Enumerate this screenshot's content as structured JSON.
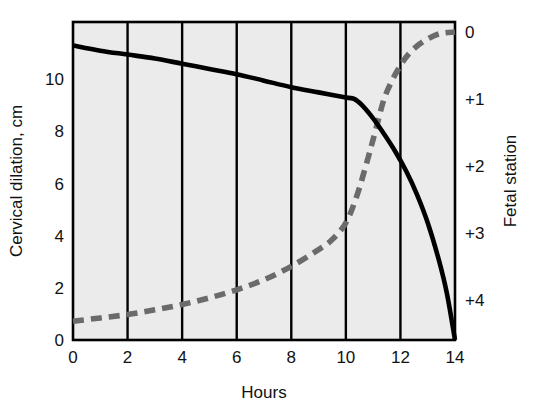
{
  "chart_data": {
    "type": "line",
    "title": "",
    "subtitle": "",
    "xlabel": "Hours",
    "ylabel": "Cervical dilation, cm",
    "y2label": "Fetal station",
    "xlim": [
      0,
      14
    ],
    "ylim": [
      0,
      12.2
    ],
    "y2lim": [
      4.6,
      -0.15
    ],
    "xticks": [
      "0",
      "2",
      "4",
      "6",
      "8",
      "10",
      "12",
      "14"
    ],
    "xtick_values": [
      0,
      2,
      4,
      6,
      8,
      10,
      12,
      14
    ],
    "yticks": [
      "0",
      "2",
      "4",
      "6",
      "8",
      "10"
    ],
    "ytick_values": [
      0,
      2,
      4,
      6,
      8,
      10
    ],
    "y2ticks": [
      "0",
      "+1",
      "+2",
      "+3",
      "+4"
    ],
    "y2tick_values": [
      0,
      1,
      2,
      3,
      4
    ],
    "grid": "vertical-only",
    "grid_color": "#000000",
    "plot_background": "#ebebeb",
    "legend": "none",
    "series": [
      {
        "name": "Cervical dilation",
        "style": "solid",
        "color": "#000000",
        "axis": "left",
        "x": [
          0,
          1,
          2,
          3,
          4,
          5,
          6,
          7,
          8,
          9,
          10,
          10.3,
          10.6,
          11,
          11.4,
          11.8,
          12.2,
          12.6,
          13,
          13.4,
          13.7,
          14
        ],
        "values": [
          11.3,
          11.1,
          10.95,
          10.8,
          10.6,
          10.4,
          10.2,
          9.95,
          9.7,
          9.5,
          9.3,
          9.25,
          9.0,
          8.5,
          7.9,
          7.25,
          6.5,
          5.6,
          4.5,
          3.1,
          1.8,
          0.0
        ]
      },
      {
        "name": "Fetal station",
        "style": "dashed",
        "color": "#6b6b6b",
        "axis": "right",
        "x": [
          0,
          1,
          2,
          3,
          4,
          5,
          6,
          7,
          8,
          9,
          9.5,
          10,
          10.4,
          10.8,
          11.1,
          11.4,
          11.7,
          12,
          12.3,
          12.7,
          13.1,
          13.5,
          14
        ],
        "values": [
          4.32,
          4.27,
          4.22,
          4.15,
          4.07,
          3.97,
          3.85,
          3.7,
          3.5,
          3.25,
          3.1,
          2.85,
          2.45,
          1.9,
          1.45,
          1.0,
          0.72,
          0.5,
          0.33,
          0.18,
          0.08,
          0.02,
          0.0
        ]
      }
    ]
  },
  "axes": {
    "x_title": "Hours",
    "y_title": "Cervical dilation, cm",
    "y2_title": "Fetal station"
  }
}
